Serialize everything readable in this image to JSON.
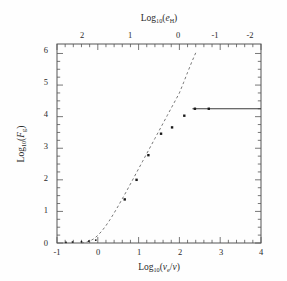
{
  "chart_data": {
    "type": "line",
    "title": "",
    "xlabel": "Log10(ve/v)",
    "ylabel": "Log10(Fg)",
    "top_axis_label": "Log10(eH)",
    "xlim": [
      -1,
      4
    ],
    "ylim": [
      0,
      6.3
    ],
    "top_xlim": [
      2.4,
      -2.4
    ],
    "grid": false,
    "legend": null,
    "xticks": [
      -1,
      0,
      1,
      2,
      3,
      4
    ],
    "xtick_labels": [
      "-1",
      "0",
      "1",
      "2",
      "3",
      "4"
    ],
    "yticks": [
      0,
      1,
      2,
      3,
      4,
      5,
      6
    ],
    "ytick_labels": [
      "0",
      "1",
      "2",
      "3",
      "4",
      "5",
      "6"
    ],
    "top_xticks": [
      2,
      1,
      0,
      -1,
      -2
    ],
    "top_xtick_labels": [
      "2",
      "1",
      "0",
      "-1",
      "-2"
    ],
    "series": [
      {
        "name": "model-curve",
        "style": "dashed",
        "x": [
          -0.4,
          -0.3,
          -0.2,
          -0.1,
          0.0,
          0.1,
          0.2,
          0.3,
          0.4,
          0.5,
          0.6,
          0.7,
          0.8,
          0.9,
          1.0,
          1.1,
          1.2,
          1.3,
          1.4,
          1.5,
          1.6,
          1.7,
          1.8,
          1.9,
          2.0,
          2.1,
          2.2,
          2.3,
          2.4
        ],
        "y": [
          0.0,
          0.02,
          0.06,
          0.13,
          0.24,
          0.38,
          0.55,
          0.74,
          0.95,
          1.17,
          1.4,
          1.63,
          1.87,
          2.11,
          2.35,
          2.59,
          2.83,
          3.07,
          3.31,
          3.55,
          3.79,
          4.03,
          4.27,
          4.51,
          4.75,
          5.07,
          5.4,
          5.72,
          6.02
        ]
      },
      {
        "name": "plateau-line",
        "style": "solid",
        "x": [
          2.32,
          4.0
        ],
        "y": [
          4.25,
          4.25
        ]
      }
    ],
    "points": [
      {
        "x": -0.78,
        "y": 0.02
      },
      {
        "x": -0.62,
        "y": 0.03
      },
      {
        "x": -0.4,
        "y": 0.04
      },
      {
        "x": -0.22,
        "y": 0.06
      },
      {
        "x": -0.05,
        "y": 0.09
      },
      {
        "x": 0.66,
        "y": 1.38
      },
      {
        "x": 0.95,
        "y": 2.0
      },
      {
        "x": 1.24,
        "y": 2.78
      },
      {
        "x": 1.55,
        "y": 3.46
      },
      {
        "x": 1.82,
        "y": 3.66
      },
      {
        "x": 2.12,
        "y": 4.03
      },
      {
        "x": 2.38,
        "y": 4.25
      },
      {
        "x": 2.72,
        "y": 4.25
      }
    ]
  },
  "axes": {
    "bottom": {
      "label_prefix": "Log",
      "label_sub": "10",
      "label_open": "(",
      "label_v": "v",
      "label_v_sub": "e",
      "label_slash": "/",
      "label_v2": "v",
      "label_close": ")"
    },
    "left": {
      "label_prefix": "Log",
      "label_sub": "10",
      "label_open": "(",
      "label_F": "F",
      "label_F_sub": "g",
      "label_close": ")"
    },
    "top": {
      "label_prefix": "Log",
      "label_sub": "10",
      "label_open": "(",
      "label_e": "e",
      "label_e_sub": "H",
      "label_close": ")"
    }
  },
  "colors": {
    "frame": "#555555",
    "curve": "#777777",
    "point": "#1a1a1a",
    "text": "#2a2a2a",
    "background": "#fefefe"
  }
}
